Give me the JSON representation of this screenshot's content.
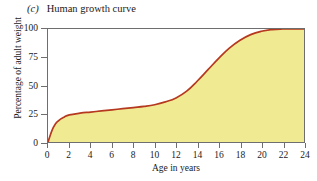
{
  "figure": {
    "panel_letter": "(c)",
    "title": "Human growth curve"
  },
  "axes": {
    "x_title": "Age in years",
    "y_title": "Percentage of adult weight"
  },
  "colors": {
    "curve": "#b5381f",
    "area_fill": "#f0ea93",
    "frame": "#6e6e6e",
    "text": "#1a1a1a",
    "background": "#ffffff"
  },
  "chart_data": {
    "type": "area",
    "title": "Human growth curve",
    "xlabel": "Age in years",
    "ylabel": "Percentage of adult weight",
    "xlim": [
      0,
      24
    ],
    "ylim": [
      0,
      100
    ],
    "xticks": [
      0,
      2,
      4,
      6,
      8,
      10,
      12,
      14,
      16,
      18,
      20,
      22,
      24
    ],
    "yticks": [
      0,
      25,
      50,
      75,
      100
    ],
    "xtick_labels": [
      "0",
      "2",
      "4",
      "6",
      "8",
      "10",
      "12",
      "14",
      "16",
      "18",
      "20",
      "22",
      "24"
    ],
    "ytick_labels": [
      "0",
      "25",
      "50",
      "75",
      "100"
    ],
    "grid": false,
    "legend": false,
    "series": [
      {
        "name": "Percentage of adult weight",
        "line_color": "#b5381f",
        "fill_color": "#f0ea93",
        "x": [
          0,
          0.5,
          1,
          1.5,
          2,
          3,
          4,
          5,
          6,
          7,
          8,
          9,
          10,
          11,
          12,
          13,
          14,
          15,
          16,
          17,
          18,
          19,
          20,
          21,
          22,
          23,
          24
        ],
        "values": [
          0,
          13,
          19,
          22,
          24,
          25.5,
          26.5,
          27.5,
          28.5,
          29.5,
          30.5,
          31.5,
          33,
          35.5,
          39,
          45,
          54,
          64,
          74,
          83,
          90,
          95,
          98,
          99.5,
          100,
          100,
          100
        ]
      }
    ]
  }
}
